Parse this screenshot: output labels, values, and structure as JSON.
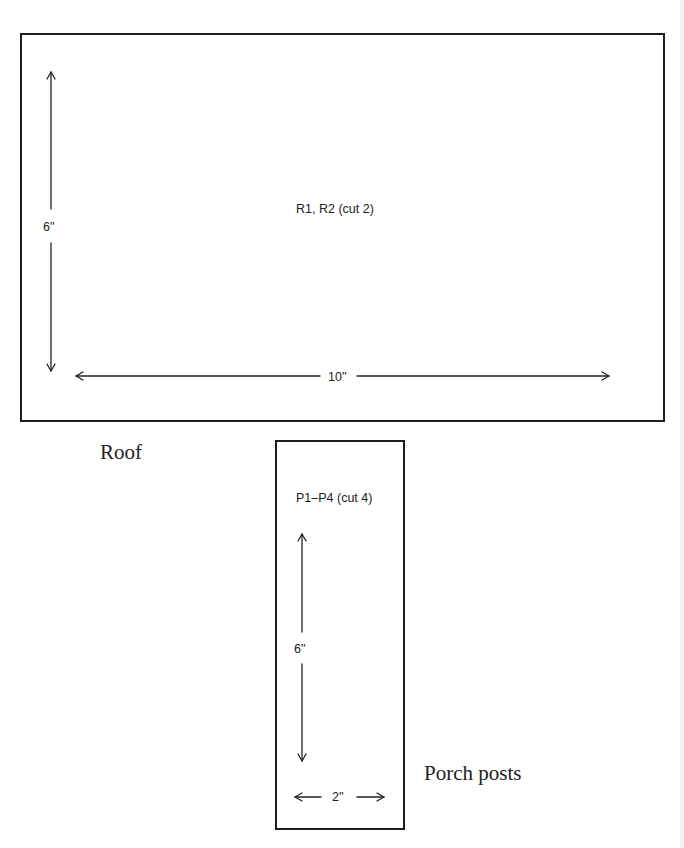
{
  "pieces": {
    "roof": {
      "caption": "Roof",
      "label": "R1, R2 (cut 2)",
      "height_dim": "6''",
      "width_dim": "10''"
    },
    "porch_posts": {
      "caption": "Porch posts",
      "label": "P1–P4 (cut 4)",
      "height_dim": "6''",
      "width_dim": "2''"
    }
  },
  "colors": {
    "outline": "#1e1e1e",
    "text": "#222222",
    "background": "#ffffff"
  }
}
